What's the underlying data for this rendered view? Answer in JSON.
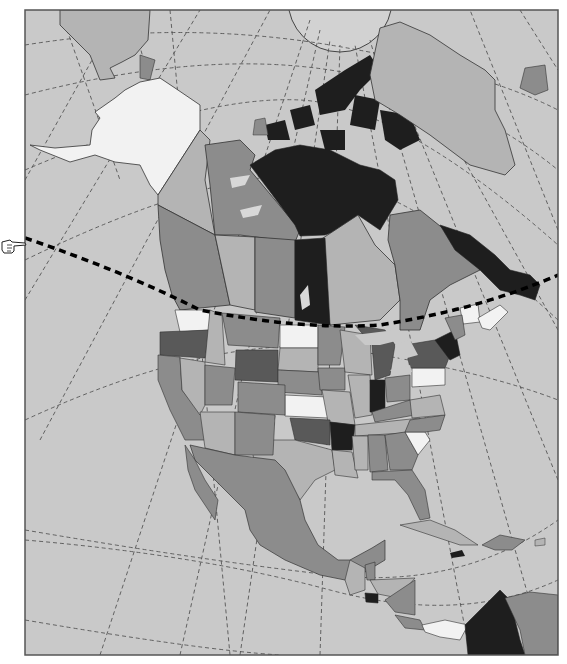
{
  "map": {
    "type": "political-map",
    "region": "North America",
    "style": "grayscale choropleth",
    "frame": {
      "x": 25,
      "y": 10,
      "width": 533,
      "height": 645,
      "stroke": "#555555"
    },
    "ocean_color": "#c9c9c9",
    "graticule": {
      "style": "dashed",
      "color": "#555555"
    },
    "pole_circle": {
      "cx": 340,
      "cy": 0,
      "r": 52,
      "fill": "#d2d2d2"
    },
    "highlight_line": {
      "style": "bold dashed",
      "color": "#000000",
      "description": "curved dashed line across continent"
    },
    "pointer_icon": "pointing-hand-icon",
    "shade_levels": {
      "white": "#f2f2f2",
      "light": "#b4b4b4",
      "mid": "#8c8c8c",
      "dark": "#595959",
      "black": "#1e1e1e",
      "land_plain": "#a6a6a6"
    },
    "regions": [
      {
        "name": "Russia (Chukotka)",
        "shade": "light"
      },
      {
        "name": "Alaska",
        "shade": "white"
      },
      {
        "name": "Yukon",
        "shade": "light"
      },
      {
        "name": "Northwest Territories",
        "shade": "mid"
      },
      {
        "name": "Nunavut",
        "shade": "black"
      },
      {
        "name": "Greenland",
        "shade": "light"
      },
      {
        "name": "Iceland",
        "shade": "mid"
      },
      {
        "name": "British Columbia",
        "shade": "mid"
      },
      {
        "name": "Alberta",
        "shade": "light"
      },
      {
        "name": "Saskatchewan",
        "shade": "mid"
      },
      {
        "name": "Manitoba",
        "shade": "black"
      },
      {
        "name": "Ontario",
        "shade": "light"
      },
      {
        "name": "Quebec",
        "shade": "mid"
      },
      {
        "name": "Newfoundland and Labrador",
        "shade": "black"
      },
      {
        "name": "New Brunswick",
        "shade": "white"
      },
      {
        "name": "Nova Scotia",
        "shade": "white"
      },
      {
        "name": "Washington",
        "shade": "white"
      },
      {
        "name": "Oregon",
        "shade": "dark"
      },
      {
        "name": "California",
        "shade": "mid"
      },
      {
        "name": "Nevada",
        "shade": "light"
      },
      {
        "name": "Idaho",
        "shade": "light"
      },
      {
        "name": "Montana",
        "shade": "mid"
      },
      {
        "name": "Wyoming",
        "shade": "dark"
      },
      {
        "name": "Utah",
        "shade": "mid"
      },
      {
        "name": "Arizona",
        "shade": "light"
      },
      {
        "name": "Colorado",
        "shade": "mid"
      },
      {
        "name": "New Mexico",
        "shade": "mid"
      },
      {
        "name": "North Dakota",
        "shade": "white"
      },
      {
        "name": "South Dakota",
        "shade": "light"
      },
      {
        "name": "Nebraska",
        "shade": "mid"
      },
      {
        "name": "Kansas",
        "shade": "white"
      },
      {
        "name": "Oklahoma",
        "shade": "dark"
      },
      {
        "name": "Texas",
        "shade": "light"
      },
      {
        "name": "Minnesota",
        "shade": "mid"
      },
      {
        "name": "Iowa",
        "shade": "mid"
      },
      {
        "name": "Missouri",
        "shade": "light"
      },
      {
        "name": "Arkansas",
        "shade": "black"
      },
      {
        "name": "Louisiana",
        "shade": "light"
      },
      {
        "name": "Wisconsin",
        "shade": "light"
      },
      {
        "name": "Illinois",
        "shade": "light"
      },
      {
        "name": "Michigan",
        "shade": "dark"
      },
      {
        "name": "Indiana",
        "shade": "black"
      },
      {
        "name": "Ohio",
        "shade": "mid"
      },
      {
        "name": "Kentucky",
        "shade": "mid"
      },
      {
        "name": "Tennessee",
        "shade": "light"
      },
      {
        "name": "Mississippi",
        "shade": "light"
      },
      {
        "name": "Alabama",
        "shade": "mid"
      },
      {
        "name": "Georgia",
        "shade": "mid"
      },
      {
        "name": "Florida",
        "shade": "mid"
      },
      {
        "name": "South Carolina",
        "shade": "white"
      },
      {
        "name": "North Carolina",
        "shade": "mid"
      },
      {
        "name": "Virginia",
        "shade": "light"
      },
      {
        "name": "West Virginia",
        "shade": "light"
      },
      {
        "name": "Pennsylvania",
        "shade": "white"
      },
      {
        "name": "New York",
        "shade": "dark"
      },
      {
        "name": "Vermont/New Hampshire",
        "shade": "black"
      },
      {
        "name": "Maine",
        "shade": "mid"
      },
      {
        "name": "Mexico",
        "shade": "mid"
      },
      {
        "name": "Guatemala",
        "shade": "light"
      },
      {
        "name": "Belize",
        "shade": "mid"
      },
      {
        "name": "El Salvador",
        "shade": "black"
      },
      {
        "name": "Honduras",
        "shade": "light"
      },
      {
        "name": "Nicaragua",
        "shade": "mid"
      },
      {
        "name": "Costa Rica",
        "shade": "mid"
      },
      {
        "name": "Panama",
        "shade": "white"
      },
      {
        "name": "Colombia",
        "shade": "black"
      },
      {
        "name": "Venezuela",
        "shade": "mid"
      },
      {
        "name": "Cuba",
        "shade": "light"
      },
      {
        "name": "Jamaica",
        "shade": "black"
      },
      {
        "name": "Hispaniola",
        "shade": "mid"
      }
    ]
  }
}
